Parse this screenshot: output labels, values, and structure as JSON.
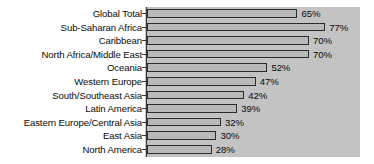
{
  "chart_data": {
    "type": "bar",
    "orientation": "horizontal",
    "title": "",
    "subtitle": "",
    "xlabel": "",
    "ylabel": "",
    "grid": false,
    "legend": null,
    "xlim": [
      0,
      92
    ],
    "value_suffix": "%",
    "categories": [
      "Global Total",
      "Sub-Saharan Africa",
      "Caribbean",
      "North Africa/Middle East",
      "Oceania",
      "Western Europe",
      "South/Southeast Asia",
      "Latin America",
      "Eastern Europe/Central Asia",
      "East Asia",
      "North America"
    ],
    "values": [
      65,
      77,
      70,
      70,
      52,
      47,
      42,
      39,
      32,
      30,
      28
    ],
    "value_labels": [
      "65%",
      "77%",
      "70%",
      "70%",
      "52%",
      "47%",
      "42%",
      "39%",
      "32%",
      "30%",
      "28%"
    ],
    "colors": {
      "bar_fill": "#b9b9b9",
      "bar_outline": "#2b2b2b",
      "plot_background": "#c3c3c3",
      "page_background": "#ffffff",
      "text": "#0a0a0a",
      "axis_line": "#3a3a3a"
    }
  }
}
